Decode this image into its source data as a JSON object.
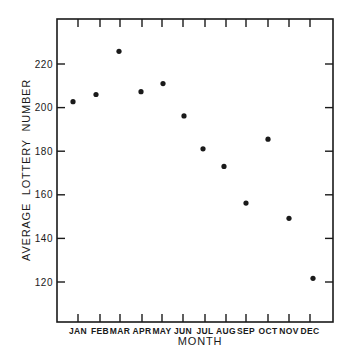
{
  "chart_data": {
    "type": "scatter",
    "title": "",
    "xlabel": "MONTH",
    "ylabel": "AVERAGE  LOTTERY  NUMBER",
    "categories": [
      "JAN",
      "FEB",
      "MAR",
      "APR",
      "MAY",
      "JUN",
      "JUL",
      "AUG",
      "SEP",
      "OCT",
      "NOV",
      "DEC"
    ],
    "values": [
      202.7,
      206.0,
      225.8,
      207.3,
      211.0,
      196.2,
      181.1,
      173.0,
      156.2,
      185.5,
      149.2,
      121.7
    ],
    "ylim": [
      102,
      241
    ],
    "yticks": [
      120,
      140,
      160,
      180,
      200,
      220
    ],
    "ytick_labels": [
      "120",
      "140",
      "160",
      "180",
      "200",
      "220"
    ],
    "grid": false,
    "legend": null,
    "frame": "box with inward ticks on all four sides"
  },
  "layout": {
    "frame": {
      "left": 57,
      "top": 19,
      "right": 333,
      "bottom": 322
    },
    "month_tick_x": [
      78,
      100,
      120,
      142,
      162,
      183,
      205,
      226,
      246,
      268,
      289,
      310
    ],
    "dot_x": [
      73,
      96,
      119,
      141,
      163,
      184,
      203,
      224,
      246,
      268,
      289,
      313
    ],
    "y_ref": {
      "value": 220,
      "pixel": 64
    },
    "px_per_unit": 2.18,
    "colors": {
      "ink": "#1a1a1a",
      "background": "#ffffff"
    }
  }
}
